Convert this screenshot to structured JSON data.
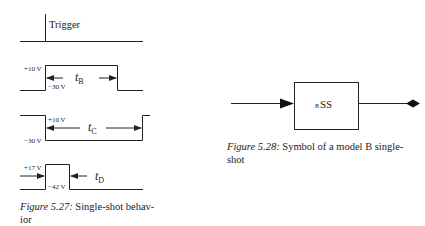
{
  "figure_527": {
    "caption_label": "Figure 5.27:",
    "caption_text": "Single-shot behavior",
    "caption_line1": "Single-shot behav-",
    "caption_line2": "ior",
    "trigger": {
      "label": "Trigger"
    },
    "waveform_b": {
      "high_label": "+10 V",
      "low_label": "−30 V",
      "duration_symbol": "t",
      "duration_sub": "B"
    },
    "waveform_c": {
      "high_label": "+10 V",
      "low_label": "−30 V",
      "duration_symbol": "t",
      "duration_sub": "C"
    },
    "waveform_d": {
      "high_label": "+17 V",
      "low_label": "−42 V",
      "duration_symbol": "t",
      "duration_sub": "D"
    }
  },
  "figure_528": {
    "caption_label": "Figure 5.28:",
    "caption_line1": "Symbol of a model B single-",
    "caption_line2": "shot",
    "block": {
      "prefix": "B",
      "label": "SS"
    },
    "input_icon": "arrow-head-icon",
    "output_icon": "diamond-icon"
  }
}
